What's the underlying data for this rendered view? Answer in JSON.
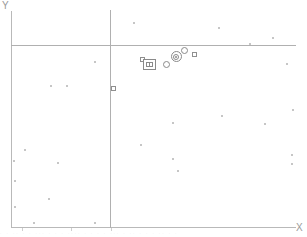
{
  "chart_data": {
    "type": "scatter",
    "title": "",
    "xlabel": "X",
    "ylabel": "Y",
    "grid": false,
    "legend": "none",
    "xlim": [
      0,
      100
    ],
    "ylim": [
      0,
      100
    ],
    "reference_lines": [
      {
        "orientation": "vertical",
        "x": 34.7,
        "color": "#b0b0b0"
      },
      {
        "orientation": "horizontal",
        "y": 83.8,
        "color": "#b0b0b0"
      }
    ],
    "axis_ticks": {
      "x": [
        4,
        21,
        35
      ],
      "y": []
    },
    "series": [
      {
        "name": "background-points",
        "marker": "dot",
        "color": "#c6c6c6",
        "points": [
          {
            "x": 43.0,
            "y": 94.0
          },
          {
            "x": 73.0,
            "y": 91.5
          },
          {
            "x": 92.0,
            "y": 87.0
          },
          {
            "x": 84.0,
            "y": 84.5
          },
          {
            "x": 29.5,
            "y": 76.0
          },
          {
            "x": 97.0,
            "y": 75.0
          },
          {
            "x": 14.0,
            "y": 65.0
          },
          {
            "x": 19.5,
            "y": 65.0
          },
          {
            "x": 36.0,
            "y": 64.5
          },
          {
            "x": 99.0,
            "y": 54.0
          },
          {
            "x": 74.0,
            "y": 51.0
          },
          {
            "x": 57.0,
            "y": 48.0
          },
          {
            "x": 89.0,
            "y": 47.5
          },
          {
            "x": 45.5,
            "y": 38.0
          },
          {
            "x": 5.0,
            "y": 35.5
          },
          {
            "x": 57.0,
            "y": 31.5
          },
          {
            "x": 98.5,
            "y": 33.0
          },
          {
            "x": 1.0,
            "y": 30.5
          },
          {
            "x": 16.5,
            "y": 29.5
          },
          {
            "x": 98.5,
            "y": 29.0
          },
          {
            "x": 58.5,
            "y": 26.0
          },
          {
            "x": 1.5,
            "y": 21.0
          },
          {
            "x": 13.5,
            "y": 13.0
          },
          {
            "x": 1.5,
            "y": 9.0
          },
          {
            "x": 8.0,
            "y": 2.0
          },
          {
            "x": 29.5,
            "y": 2.0
          }
        ]
      },
      {
        "name": "cluster-small-squares",
        "marker": "square-open",
        "color": "#8f8f8f",
        "points": [
          {
            "x": 46.0,
            "y": 77.0
          },
          {
            "x": 64.5,
            "y": 79.5
          },
          {
            "x": 36.0,
            "y": 64.0
          }
        ]
      },
      {
        "name": "cluster-open-circles",
        "marker": "circle-open",
        "color": "#8a8a8a",
        "points": [
          {
            "x": 54.5,
            "y": 75.0
          },
          {
            "x": 61.0,
            "y": 81.5
          }
        ]
      },
      {
        "name": "highlight-bullseye",
        "marker": "concentric-circle",
        "color": "#8a8a8a",
        "points": [
          {
            "x": 58.0,
            "y": 78.5
          }
        ]
      },
      {
        "name": "highlight-boxed",
        "marker": "nested-square",
        "color": "#8a8a8a",
        "points": [
          {
            "x": 48.5,
            "y": 75.0
          }
        ]
      }
    ]
  },
  "axis": {
    "y_label": "Y",
    "x_label": "X"
  },
  "colors": {
    "axis": "#b9b9b9",
    "reference": "#b0b0b0",
    "point": "#c6c6c6",
    "marker": "#8a8a8a"
  },
  "footer": {
    "artifact_text": "· · ·· · · ··· · · · ···· · · · · ··· · ·· · · · ·· · ·"
  }
}
